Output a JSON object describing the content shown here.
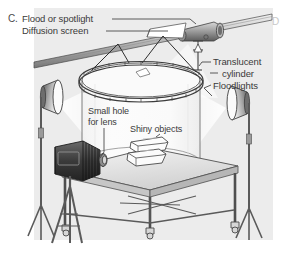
{
  "figure": {
    "panel_letter": "C.",
    "next_panel_letter": "D",
    "background_color": "#e9e9e9",
    "page_color": "#ffffff",
    "ink_color": "#3a3a3a"
  },
  "labels": {
    "flood_or_spotlight": "Flood or spotlight",
    "diffusion_screen": "Diffusion screen",
    "translucent": "Translucent",
    "cylinder": "cylinder",
    "floodlights": "Floodlights",
    "small_hole": "Small hole",
    "for_lens": "for lens",
    "shiny_objects": "Shiny objects"
  },
  "scene_parts": {
    "overhead_bar": "overhead-support-bar",
    "spotlight": "spotlight-housing",
    "diffusion_screen": "diffusion-screen-flap",
    "translucent_cylinder": "translucent-cylinder",
    "cylinder_rim": "segmented-top-rim",
    "suspension_wires": "suspension-wires",
    "left_floodlight": "left-floodlight",
    "right_floodlight": "right-floodlight",
    "camera": "bellows-camera",
    "tripod": "camera-tripod",
    "table": "wheeled-table",
    "shiny_objects": "stacked-shiny-bowls"
  }
}
